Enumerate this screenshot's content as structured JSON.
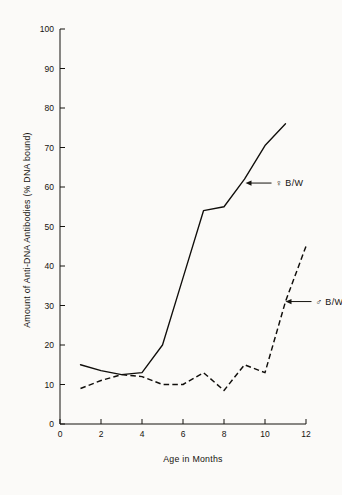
{
  "chart_data": {
    "type": "line",
    "title": "",
    "xlabel": "Age in Months",
    "ylabel": "Amount of Anti-DNA Antibodies (% DNA bound)",
    "xlim": [
      0,
      12
    ],
    "ylim": [
      0,
      100
    ],
    "xticks": [
      0,
      2,
      4,
      6,
      8,
      10,
      12
    ],
    "yticks": [
      0,
      10,
      20,
      30,
      40,
      50,
      60,
      70,
      80,
      90,
      100
    ],
    "xtick_labels": [
      "0",
      "2",
      "4",
      "6",
      "8",
      "10",
      "12"
    ],
    "ytick_labels": [
      "0",
      "10",
      "20",
      "30",
      "40",
      "50",
      "60",
      "70",
      "80",
      "90",
      "100"
    ],
    "grid": false,
    "legend_position": "inline-annotations",
    "series": [
      {
        "name": "♀ B/W",
        "symbol": "♀",
        "group": "B/W",
        "style": "solid",
        "color": "#100e0b",
        "x": [
          1,
          2,
          3,
          4,
          5,
          6,
          7,
          8,
          9,
          10,
          11
        ],
        "values": [
          15,
          13.5,
          12.5,
          13,
          20,
          37,
          54,
          55,
          62,
          70.5,
          76
        ]
      },
      {
        "name": "♂ B/W",
        "symbol": "♂",
        "group": "B/W",
        "style": "dashed",
        "color": "#100e0b",
        "x": [
          1,
          2,
          3,
          4,
          5,
          6,
          7,
          8,
          9,
          10,
          11,
          12
        ],
        "values": [
          9,
          11,
          12.5,
          12,
          10,
          10,
          13,
          8.5,
          15,
          13,
          31,
          45
        ]
      }
    ],
    "annotations": [
      {
        "text": "♀ B/W",
        "points_to_series": "♀ B/W",
        "arrow_direction": "left",
        "at_x": 9.05,
        "at_y": 61
      },
      {
        "text": "♂ B/W",
        "points_to_series": "♂ B/W",
        "arrow_direction": "left",
        "at_x": 11.0,
        "at_y": 31
      }
    ]
  },
  "figure": {
    "background_color": "#fbfaf8",
    "ink_color": "#15130f"
  }
}
